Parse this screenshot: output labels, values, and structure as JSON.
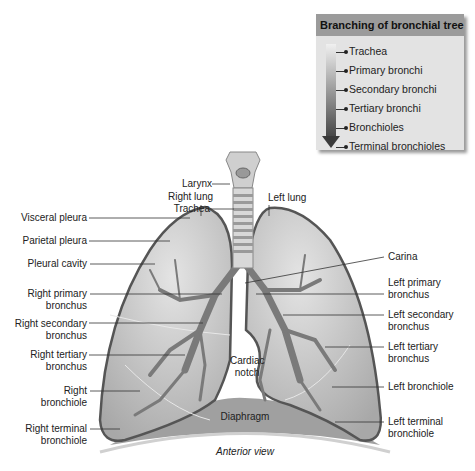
{
  "legend": {
    "title": "Branching of bronchial tree",
    "items": [
      "Trachea",
      "Primary bronchi",
      "Secondary bronchi",
      "Tertiary bronchi",
      "Bronchioles",
      "Terminal bronchioles"
    ]
  },
  "labels": {
    "larynx": "Larynx",
    "trachea": "Trachea",
    "right_lung": "Right lung",
    "left_lung": "Left lung",
    "visceral_pleura": "Visceral pleura",
    "parietal_pleura": "Parietal pleura",
    "pleural_cavity": "Pleural cavity",
    "right_primary_bronchus": [
      "Right primary",
      "bronchus"
    ],
    "right_secondary_bronchus": [
      "Right secondary",
      "bronchus"
    ],
    "right_tertiary_bronchus": [
      "Right tertiary",
      "bronchus"
    ],
    "right_bronchiole": [
      "Right",
      "bronchiole"
    ],
    "right_terminal_bronchiole": [
      "Right terminal",
      "bronchiole"
    ],
    "carina": "Carina",
    "left_primary_bronchus": [
      "Left primary",
      "bronchus"
    ],
    "left_secondary_bronchus": [
      "Left secondary",
      "bronchus"
    ],
    "left_tertiary_bronchus": [
      "Left tertiary",
      "bronchus"
    ],
    "left_bronchiole": "Left bronchiole",
    "left_terminal_bronchiole": [
      "Left terminal",
      "bronchiole"
    ],
    "cardiac_notch": [
      "Cardiac",
      "notch"
    ],
    "diaphragm": "Diaphragm",
    "caption": "Anterior view"
  }
}
